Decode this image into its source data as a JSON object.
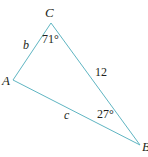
{
  "diagram": {
    "type": "triangle",
    "line_color": "#5fb5c2",
    "text_color": "#231f20",
    "vertices": [
      {
        "name": "C",
        "x": 51,
        "y": 23
      },
      {
        "name": "A",
        "x": 13,
        "y": 80
      },
      {
        "name": "B",
        "x": 140,
        "y": 145
      }
    ],
    "vertex_labels": {
      "C": "C",
      "A": "A",
      "B": "B"
    },
    "side_labels": {
      "b": "b",
      "a": "12",
      "c": "c"
    },
    "angle_labels": {
      "C": "71°",
      "B": "27°"
    }
  }
}
